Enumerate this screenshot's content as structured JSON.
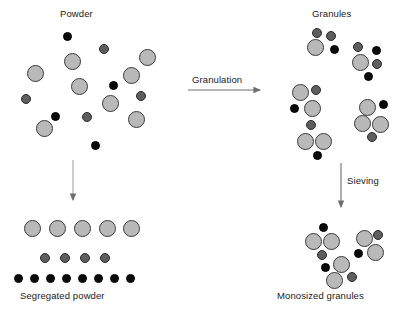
{
  "figure": {
    "type": "process-flow-diagram",
    "background_color": "#ffffff"
  },
  "colors": {
    "large_particle_fill": "#b9b9b9",
    "large_particle_stroke": "#3a3a3a",
    "medium_particle_fill": "#5e5e5e",
    "medium_particle_stroke": "#2a2a2a",
    "small_particle_fill": "#0a0a0a",
    "small_particle_stroke": "#000000",
    "arrow_color": "#6e6e6e",
    "text_color": "#1a1a1a"
  },
  "labels": {
    "powder": "Powder",
    "granules": "Granules",
    "segregated_powder": "Segregated powder",
    "monosized_granules": "Monosized granules",
    "granulation": "Granulation",
    "sieving": "Sieving"
  },
  "arrows": [
    {
      "name": "granulation-arrow",
      "direction": "right",
      "label": "Granulation",
      "x": 188,
      "y": 90,
      "length": 76
    },
    {
      "name": "sieving-arrow",
      "direction": "down",
      "label": "Sieving",
      "x": 341,
      "y": 163,
      "length": 48
    },
    {
      "name": "segregation-arrow",
      "direction": "down",
      "label": "",
      "x": 73,
      "y": 160,
      "length": 44
    }
  ],
  "powder_particles": [
    {
      "size": "small",
      "cx": 67,
      "cy": 36
    },
    {
      "size": "medium",
      "cx": 104,
      "cy": 49
    },
    {
      "size": "large",
      "cx": 72,
      "cy": 61
    },
    {
      "size": "large",
      "cx": 147,
      "cy": 57
    },
    {
      "size": "large",
      "cx": 35,
      "cy": 73
    },
    {
      "size": "large",
      "cx": 131,
      "cy": 75
    },
    {
      "size": "large",
      "cx": 79,
      "cy": 86
    },
    {
      "size": "small",
      "cx": 113,
      "cy": 85
    },
    {
      "size": "medium",
      "cx": 26,
      "cy": 99
    },
    {
      "size": "medium",
      "cx": 141,
      "cy": 96
    },
    {
      "size": "large",
      "cx": 110,
      "cy": 103
    },
    {
      "size": "small",
      "cx": 55,
      "cy": 116
    },
    {
      "size": "medium",
      "cx": 87,
      "cy": 117
    },
    {
      "size": "large",
      "cx": 136,
      "cy": 119
    },
    {
      "size": "large",
      "cx": 44,
      "cy": 128
    },
    {
      "size": "small",
      "cx": 95,
      "cy": 145
    }
  ],
  "granule_clusters": [
    {
      "name": "granule-cluster-1",
      "members": [
        {
          "size": "large",
          "cx": 315,
          "cy": 47
        },
        {
          "size": "medium",
          "cx": 317,
          "cy": 33
        },
        {
          "size": "medium",
          "cx": 331,
          "cy": 36
        },
        {
          "size": "small",
          "cx": 334,
          "cy": 49
        }
      ]
    },
    {
      "name": "granule-cluster-2",
      "members": [
        {
          "size": "large",
          "cx": 360,
          "cy": 62
        },
        {
          "size": "medium",
          "cx": 358,
          "cy": 47
        },
        {
          "size": "small",
          "cx": 376,
          "cy": 50
        },
        {
          "size": "medium",
          "cx": 377,
          "cy": 64
        },
        {
          "size": "small",
          "cx": 368,
          "cy": 76
        }
      ]
    },
    {
      "name": "granule-cluster-3",
      "members": [
        {
          "size": "large",
          "cx": 300,
          "cy": 92
        },
        {
          "size": "medium",
          "cx": 316,
          "cy": 90
        },
        {
          "size": "small",
          "cx": 294,
          "cy": 108
        },
        {
          "size": "large",
          "cx": 312,
          "cy": 108
        }
      ]
    },
    {
      "name": "granule-cluster-4",
      "members": [
        {
          "size": "large",
          "cx": 367,
          "cy": 107
        },
        {
          "size": "small",
          "cx": 383,
          "cy": 104
        },
        {
          "size": "large",
          "cx": 362,
          "cy": 123
        },
        {
          "size": "large",
          "cx": 380,
          "cy": 124
        },
        {
          "size": "medium",
          "cx": 372,
          "cy": 137
        }
      ]
    },
    {
      "name": "granule-cluster-5",
      "members": [
        {
          "size": "medium",
          "cx": 311,
          "cy": 125
        },
        {
          "size": "large",
          "cx": 305,
          "cy": 141
        },
        {
          "size": "large",
          "cx": 323,
          "cy": 141
        },
        {
          "size": "small",
          "cx": 317,
          "cy": 155
        }
      ]
    }
  ],
  "segregated_rows": [
    {
      "name": "segregated-row-large",
      "size": "large",
      "y": 228,
      "x_positions": [
        32,
        57,
        82,
        107,
        131
      ]
    },
    {
      "name": "segregated-row-medium",
      "size": "medium",
      "y": 258,
      "x_positions": [
        45,
        65,
        85,
        105
      ]
    },
    {
      "name": "segregated-row-small",
      "size": "small",
      "y": 278,
      "x_positions": [
        18,
        34,
        50,
        66,
        82,
        98,
        114,
        130
      ]
    }
  ],
  "monosized_clusters": [
    {
      "name": "monosized-cluster-1",
      "members": [
        {
          "size": "small",
          "cx": 323,
          "cy": 227
        },
        {
          "size": "large",
          "cx": 313,
          "cy": 241
        },
        {
          "size": "large",
          "cx": 331,
          "cy": 241
        },
        {
          "size": "medium",
          "cx": 322,
          "cy": 255
        }
      ]
    },
    {
      "name": "monosized-cluster-2",
      "members": [
        {
          "size": "large",
          "cx": 364,
          "cy": 238
        },
        {
          "size": "medium",
          "cx": 378,
          "cy": 235
        },
        {
          "size": "small",
          "cx": 358,
          "cy": 253
        },
        {
          "size": "large",
          "cx": 375,
          "cy": 252
        }
      ]
    },
    {
      "name": "monosized-cluster-3",
      "members": [
        {
          "size": "large",
          "cx": 341,
          "cy": 264
        },
        {
          "size": "small",
          "cx": 325,
          "cy": 267
        },
        {
          "size": "large",
          "cx": 334,
          "cy": 280
        },
        {
          "size": "medium",
          "cx": 352,
          "cy": 277
        }
      ]
    }
  ],
  "particle_sizes": {
    "large": 17,
    "medium": 10,
    "small": 9
  }
}
